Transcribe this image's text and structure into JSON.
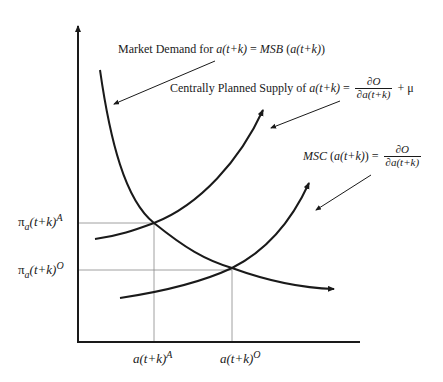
{
  "diagram": {
    "type": "supply-demand",
    "curves": {
      "demand": {
        "label_prefix": "Market Demand for ",
        "label_var": "a(t+k)",
        "label_eq": " = ",
        "label_rhs_it": "MSB",
        "label_rhs": " (",
        "label_rhs_var": "a(t+k)",
        "label_rhs_close": ")"
      },
      "planned_supply": {
        "label_prefix": "Centrally Planned Supply of ",
        "label_var": "a(t+k)",
        "label_eq": " = ",
        "frac_num": "∂O",
        "frac_den": "∂a(t+k)",
        "label_suffix": " + μ"
      },
      "msc": {
        "label_it": "MSC",
        "label_mid": " (",
        "label_var": "a(t+k)",
        "label_close": ") = ",
        "frac_num": "∂O",
        "frac_den": "∂a(t+k)"
      }
    },
    "y_ticks": [
      {
        "base": "π",
        "sub": "a",
        "rest": "(t+k)",
        "sup": "A"
      },
      {
        "base": "π",
        "sub": "a",
        "rest": "(t+k)",
        "sup": "O"
      }
    ],
    "x_ticks": [
      {
        "base": "a(t+k)",
        "sup": "A"
      },
      {
        "base": "a(t+k)",
        "sup": "O"
      }
    ],
    "colors": {
      "line": "#1a1a1a",
      "guide": "#888888",
      "background": "#ffffff"
    }
  }
}
